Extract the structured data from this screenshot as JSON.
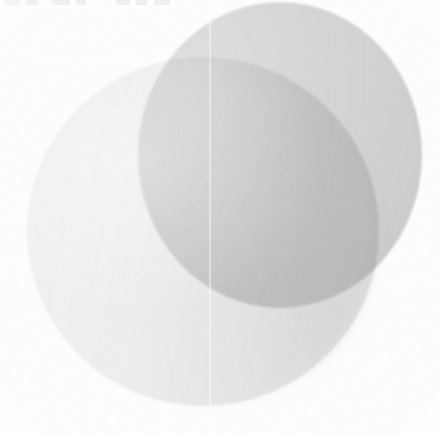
{
  "image": {
    "title": "Overlapping translucent discs",
    "description": "Two large overlapping light-gray circular shapes on a plain white background, rendered with soft blurred edges and subtle paper-grain texture.",
    "width": 441,
    "height": 434,
    "background_color": "#ffffff",
    "has_text": false,
    "style": "soft-focus abstract grayscale"
  },
  "palette": {
    "background": "#ffffff",
    "front_disc_light": "#f3f3f3",
    "front_disc_mid": "#eeeeee",
    "front_disc_dark": "#dddddd",
    "back_disc_light": "#e0e0e0",
    "back_disc_mid": "#d6d6d6",
    "back_disc_dark": "#c9c9c9",
    "intersection": "#e2e2e2",
    "seam_line": "#fbfbfb",
    "artifact_mark": "#ececee"
  },
  "shapes": [
    {
      "name": "back-disc",
      "role": "upper-right darker circle",
      "left": 138,
      "top": 2,
      "width": 284,
      "height": 306,
      "fill": "#d6d6d6",
      "blur_px": 1.1,
      "layer": 1
    },
    {
      "name": "front-disc",
      "role": "lower-left lighter circle with left-to-right gradient",
      "left": 27,
      "top": 57,
      "width": 352,
      "height": 349,
      "fill": "#eeeeee",
      "blur_px": 1.0,
      "layer": 2
    }
  ],
  "artifacts": {
    "scan_seam": {
      "name": "vertical-scan-seam",
      "x": 209,
      "width": 2,
      "color": "#fbfbfb",
      "orientation": "vertical",
      "spans_full_height": true
    },
    "top_edge_marks": [
      {
        "left": 4,
        "width": 16
      },
      {
        "left": 26,
        "width": 12
      },
      {
        "left": 52,
        "width": 18
      },
      {
        "left": 76,
        "width": 10
      },
      {
        "left": 116,
        "width": 14
      },
      {
        "left": 136,
        "width": 11
      },
      {
        "left": 154,
        "width": 16
      }
    ],
    "grain": {
      "name": "paper-grain",
      "opacity": 0.3,
      "blend_mode": "multiply"
    }
  }
}
